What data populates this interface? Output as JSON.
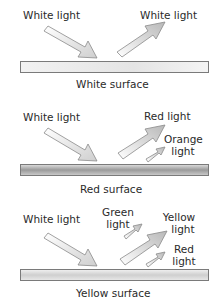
{
  "panels": [
    {
      "surface_label": "White surface",
      "incoming_label": "White light",
      "outgoing": [
        {
          "label": "White light"
        }
      ]
    },
    {
      "surface_label": "Red surface",
      "incoming_label": "White light",
      "outgoing": [
        {
          "label": "Red light"
        },
        {
          "label_line1": "Orange",
          "label_line2": "light"
        }
      ]
    },
    {
      "surface_label": "Yellow surface",
      "incoming_label": "White light",
      "outgoing": [
        {
          "label_line1": "Green",
          "label_line2": "light"
        },
        {
          "label_line1": "Yellow",
          "label_line2": "light"
        },
        {
          "label_line1": "Red",
          "label_line2": "light"
        }
      ]
    }
  ],
  "colors": {
    "arrow_fill_light": "#f4f4f4",
    "arrow_fill_dark": "#bdbdbd",
    "arrow_stroke": "#8a8a8a",
    "surface_border": "#7a7a7a"
  }
}
